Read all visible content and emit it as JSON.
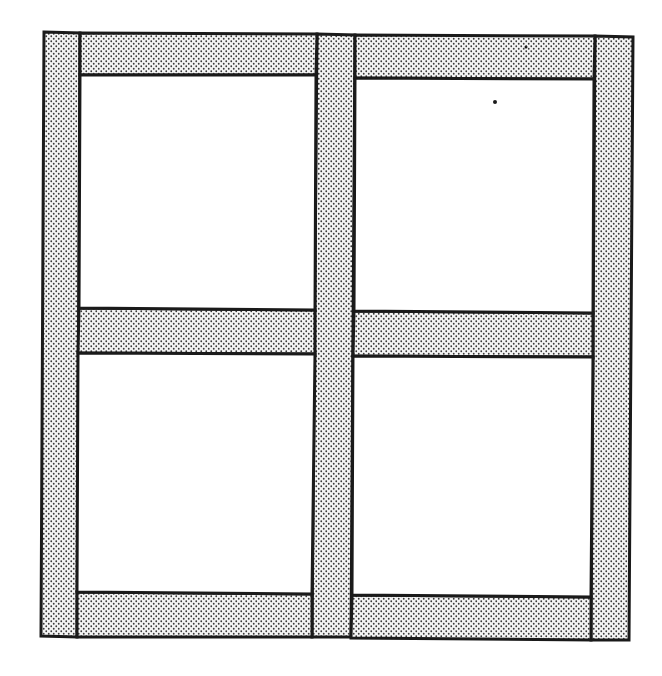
{
  "figure": {
    "width": 662,
    "height": 676,
    "colors": {
      "background": "#ffffff",
      "outline": "#1a1a1a",
      "stipple_dot": "#3a3a3a",
      "stipple_bg": "#f4f4f4",
      "panel": "#ffffff"
    },
    "stroke_width": 3,
    "stipple": {
      "spacing": 5,
      "dot_radius": 0.9
    },
    "members": [
      {
        "name": "left-stile",
        "points": "44,32 80,33 77,637 41,636"
      },
      {
        "name": "center-mullion",
        "points": "317,34 355,35 351,637 312,637"
      },
      {
        "name": "right-stile",
        "points": "595,36 633,37 629,640 591,640"
      },
      {
        "name": "top-rail-left",
        "points": "80,33 317,34 316,75 80,75"
      },
      {
        "name": "top-rail-right",
        "points": "355,35 595,36 594,79 355,78"
      },
      {
        "name": "mid-rail-left",
        "points": "79,308 315,310 315,354 78,353"
      },
      {
        "name": "mid-rail-right",
        "points": "354,311 593,313 593,357 353,356"
      },
      {
        "name": "bottom-rail-left",
        "points": "77,592 312,594 312,637 77,637"
      },
      {
        "name": "bottom-rail-right",
        "points": "352,595 591,597 591,640 351,638"
      }
    ],
    "panels": [
      {
        "name": "panel-top-left",
        "points": "80,75 316,75 315,310 79,308"
      },
      {
        "name": "panel-top-right",
        "points": "355,78 594,79 593,313 354,311"
      },
      {
        "name": "panel-bottom-left",
        "points": "78,353 315,354 312,594 77,592"
      },
      {
        "name": "panel-bottom-right",
        "points": "353,356 593,357 591,597 352,595"
      }
    ],
    "specks": [
      {
        "name": "speck-top-right-rail",
        "cx": 526,
        "cy": 47,
        "r": 1.5
      },
      {
        "name": "speck-top-right-panel",
        "cx": 495,
        "cy": 102,
        "r": 2
      }
    ]
  }
}
